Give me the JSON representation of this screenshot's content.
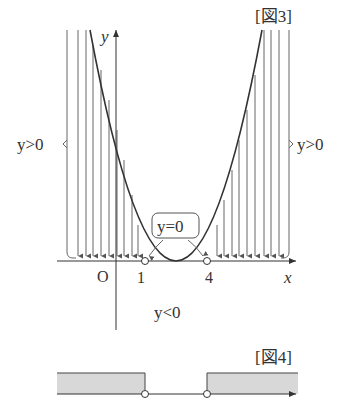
{
  "figure3": {
    "caption": "[図3]",
    "axis_x_label": "x",
    "axis_y_label": "y",
    "origin_label": "O",
    "root1_label": "1",
    "root2_label": "4",
    "left_region_label": "y>0",
    "right_region_label": "y>0",
    "roots_label": "y=0",
    "below_label": "y<0"
  },
  "figure4": {
    "caption": "[図4]"
  },
  "colors": {
    "line": "#3a3a3a",
    "thin_line": "#555555",
    "shade": "#d8d8d8"
  }
}
